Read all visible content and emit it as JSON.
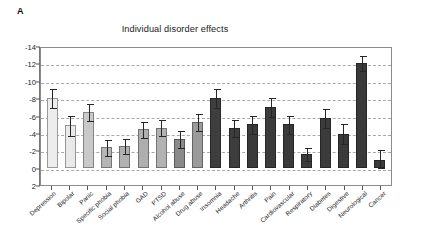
{
  "panel": {
    "letter": "A"
  },
  "margin_note": {
    "lines": [
      "",
      "",
      "",
      ""
    ]
  },
  "chart_data": {
    "type": "bar",
    "title": "Individual disorder effects",
    "xlabel": "",
    "ylabel": "",
    "ylim": [
      2,
      -14
    ],
    "yticks": [
      -14,
      -12,
      -10,
      -8,
      -6,
      -4,
      -2,
      0,
      2
    ],
    "ytick_labels": [
      "-14",
      "-12",
      "-10",
      "-8",
      "-6",
      "-4",
      "-2",
      "0",
      "2"
    ],
    "grid": true,
    "legend": "none",
    "orientation": "vertical",
    "error_bars": "95% CI",
    "categories": [
      "Depression",
      "Bipolar",
      "Panic",
      "Specific phobia",
      "Social phobia",
      "GAD",
      "PTSD",
      "Alcohol abuse",
      "Drug abuse",
      "Insomnia",
      "Headache",
      "Arthritis",
      "Pain",
      "Cardiovascular",
      "Respiratory",
      "Diabetes",
      "Digestive",
      "Neurological",
      "Cancer"
    ],
    "values": [
      -8.0,
      -4.9,
      -6.4,
      -2.35,
      -2.5,
      -4.4,
      -4.6,
      -3.3,
      -5.25,
      -8.0,
      -4.6,
      -5.0,
      -7.0,
      -5.0,
      -1.55,
      -5.7,
      -3.9,
      -12.0,
      -0.9
    ],
    "err_low": [
      -7.0,
      -3.8,
      -5.5,
      -1.5,
      -1.7,
      -3.5,
      -3.8,
      -2.4,
      -4.3,
      -7.0,
      -3.6,
      -4.0,
      -6.0,
      -4.0,
      -0.9,
      -4.7,
      -2.8,
      -11.2,
      -0.1
    ],
    "err_high": [
      -9.0,
      -6.0,
      -7.3,
      -3.2,
      -3.3,
      -5.3,
      -5.5,
      -4.2,
      -6.2,
      -9.0,
      -5.5,
      -6.0,
      -8.0,
      -6.0,
      -2.3,
      -6.8,
      -5.0,
      -12.8,
      -2.0
    ],
    "bar_colors": [
      "#ededed",
      "#e9e9e9",
      "#c9c9c9",
      "#b5b5b5",
      "#b0b0b0",
      "#aeaeae",
      "#b2b2b2",
      "#8a8a8a",
      "#9a9a9a",
      "#3e3e3e",
      "#3d3d3d",
      "#3a3a3a",
      "#3b3b3b",
      "#3a3a3a",
      "#3c3c3c",
      "#3b3b3b",
      "#3a3a3a",
      "#393939",
      "#3a3a3a"
    ]
  },
  "colors": {
    "axis": "#777777",
    "grid": "#9a9a9a",
    "error_bar": "#262626",
    "text": "#1f1f1f"
  }
}
